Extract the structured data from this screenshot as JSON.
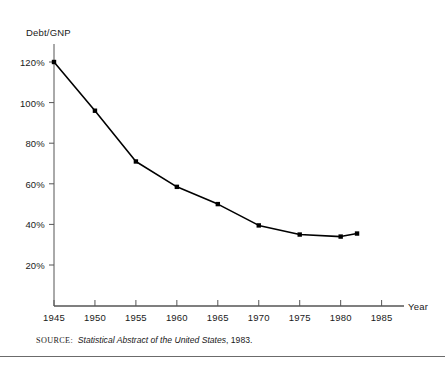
{
  "chart_data": {
    "type": "line",
    "title": "",
    "xlabel": "Year",
    "ylabel": "Debt/GNP",
    "x": [
      1945,
      1950,
      1955,
      1960,
      1965,
      1970,
      1975,
      1980,
      1982
    ],
    "values": [
      120,
      96,
      71,
      58.5,
      50,
      39.5,
      35,
      34,
      35.5
    ],
    "series": [
      {
        "name": "Debt/GNP",
        "values": [
          120,
          96,
          71,
          58.5,
          50,
          39.5,
          35,
          34,
          35.5
        ]
      }
    ],
    "xlim": [
      1945,
      1987
    ],
    "ylim": [
      0,
      126
    ],
    "xticks": [
      1945,
      1950,
      1955,
      1960,
      1965,
      1970,
      1975,
      1980,
      1985
    ],
    "xtick_labels": [
      "1945",
      "1950",
      "1955",
      "1960",
      "1965",
      "1970",
      "1975",
      "1980",
      "1985"
    ],
    "yticks": [
      20,
      40,
      60,
      80,
      100,
      120
    ],
    "ytick_labels": [
      "20%",
      "40%",
      "60%",
      "80%",
      "100%",
      "120%"
    ],
    "grid": false,
    "legend": false,
    "marker": "square",
    "line_color": "#000000",
    "marker_color": "#000000",
    "axis_color": "#555555"
  },
  "source": {
    "kicker": "SOURCE:",
    "title": "Statistical Abstract of the United States",
    "suffix": ", 1983."
  }
}
